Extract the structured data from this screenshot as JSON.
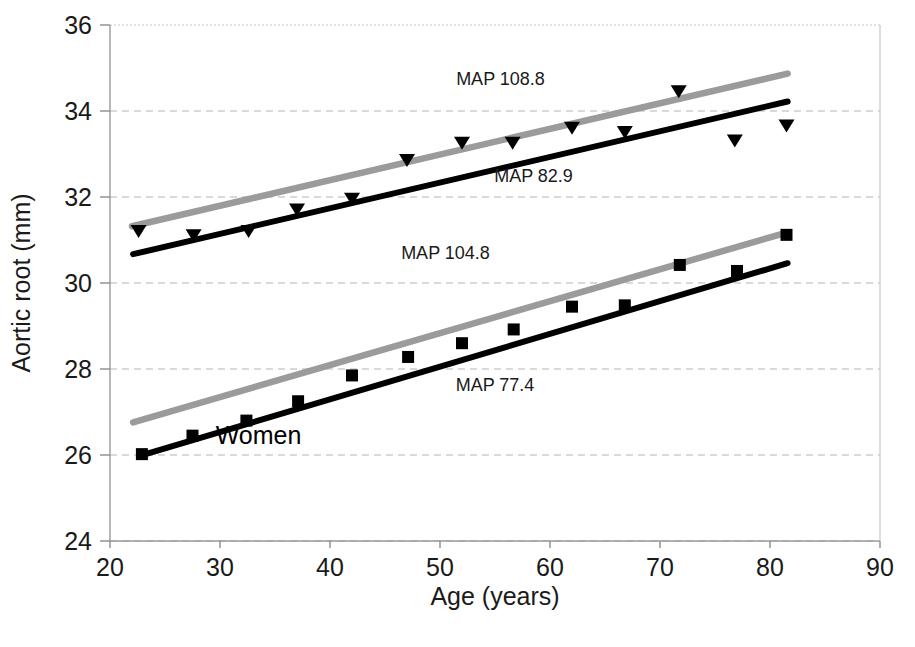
{
  "figure": {
    "caption_visible": false
  },
  "chart_data": {
    "type": "scatter",
    "title": "",
    "xlabel": "Age (years)",
    "ylabel": "Aortic root (mm)",
    "xlim": [
      20,
      90
    ],
    "ylim": [
      24,
      36
    ],
    "xticks": [
      20,
      30,
      40,
      50,
      60,
      70,
      80,
      90
    ],
    "yticks": [
      24,
      26,
      28,
      30,
      32,
      34,
      36
    ],
    "grid": "horizontal-dashed",
    "legend": "none",
    "group_labels": [
      {
        "text": "Women",
        "x": 33.5,
        "y": 26.25
      }
    ],
    "annotations": [
      {
        "text": "MAP 108.8",
        "x": 55.5,
        "y": 34.6
      },
      {
        "text": "MAP 82.9",
        "x": 58.5,
        "y": 32.35
      },
      {
        "text": "MAP 104.8",
        "x": 50.5,
        "y": 30.55
      },
      {
        "text": "MAP 77.4",
        "x": 55.0,
        "y": 27.5
      }
    ],
    "series": [
      {
        "name": "Men MAP 108.8 regression",
        "kind": "line",
        "color": "#9b9b9b",
        "x": [
          22.0,
          81.6
        ],
        "y": [
          31.32,
          34.87
        ]
      },
      {
        "name": "Men MAP 82.9 regression",
        "kind": "line",
        "color": "#000000",
        "x": [
          22.1,
          81.6
        ],
        "y": [
          30.67,
          34.22
        ]
      },
      {
        "name": "Men observed means",
        "kind": "scatter",
        "marker": "triangle-down",
        "color": "#000000",
        "points": [
          {
            "x": 22.6,
            "y": 31.2
          },
          {
            "x": 27.6,
            "y": 31.1
          },
          {
            "x": 32.6,
            "y": 31.2
          },
          {
            "x": 37.0,
            "y": 31.7
          },
          {
            "x": 42.0,
            "y": 31.95
          },
          {
            "x": 47.0,
            "y": 32.85
          },
          {
            "x": 52.0,
            "y": 33.25
          },
          {
            "x": 56.6,
            "y": 33.25
          },
          {
            "x": 62.0,
            "y": 33.6
          },
          {
            "x": 66.8,
            "y": 33.5
          },
          {
            "x": 71.7,
            "y": 34.45
          },
          {
            "x": 76.8,
            "y": 33.3
          },
          {
            "x": 81.5,
            "y": 33.65
          }
        ]
      },
      {
        "name": "Women MAP 104.8 regression",
        "kind": "line",
        "color": "#9b9b9b",
        "x": [
          22.1,
          81.6
        ],
        "y": [
          26.76,
          31.18
        ]
      },
      {
        "name": "Women MAP 77.4 regression",
        "kind": "line",
        "color": "#000000",
        "x": [
          22.7,
          81.6
        ],
        "y": [
          25.98,
          30.46
        ]
      },
      {
        "name": "Women observed means",
        "kind": "scatter",
        "marker": "square",
        "color": "#000000",
        "points": [
          {
            "x": 22.9,
            "y": 26.02
          },
          {
            "x": 27.5,
            "y": 26.45
          },
          {
            "x": 32.4,
            "y": 26.8
          },
          {
            "x": 37.1,
            "y": 27.25
          },
          {
            "x": 42.0,
            "y": 27.85
          },
          {
            "x": 47.1,
            "y": 28.28
          },
          {
            "x": 52.0,
            "y": 28.6
          },
          {
            "x": 56.7,
            "y": 28.92
          },
          {
            "x": 62.0,
            "y": 29.45
          },
          {
            "x": 66.8,
            "y": 29.48
          },
          {
            "x": 71.8,
            "y": 30.42
          },
          {
            "x": 77.0,
            "y": 30.28
          },
          {
            "x": 81.5,
            "y": 31.12
          }
        ]
      }
    ]
  },
  "axes": {
    "x_tick_labels": [
      "20",
      "30",
      "40",
      "50",
      "60",
      "70",
      "80",
      "90"
    ],
    "y_tick_labels": [
      "24",
      "26",
      "28",
      "30",
      "32",
      "34",
      "36"
    ],
    "x_title": "Age (years)",
    "y_title": "Aortic root (mm)"
  },
  "colors": {
    "high_map_line": "#9b9b9b",
    "low_map_line": "#000000",
    "grid": "#b4b4b4",
    "axis": "#9a9a9a",
    "text": "#1a1a1a",
    "background": "#ffffff"
  }
}
